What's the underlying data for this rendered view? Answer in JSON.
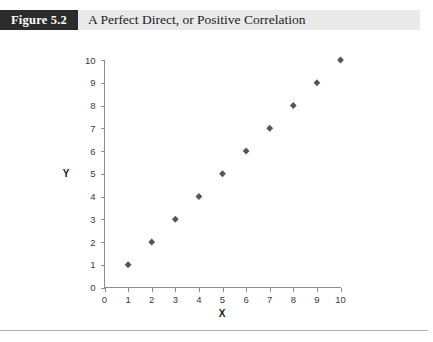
{
  "figure": {
    "badge_label": "Figure 5.2",
    "title": "A Perfect Direct, or Positive Correlation"
  },
  "colors": {
    "badge_background": "#2b2b2b",
    "badge_text": "#ffffff",
    "header_band": "#e9e9e9",
    "marker": "#565656",
    "axis": "#8d8d8d",
    "tick_text": "#3a3a3a",
    "rule": "#b0b0b0"
  },
  "chart_data": {
    "type": "scatter",
    "title": "A Perfect Direct, or Positive Correlation",
    "xlabel": "X",
    "ylabel": "Y",
    "xlim": [
      0,
      10
    ],
    "ylim": [
      0,
      10
    ],
    "xticks": [
      0,
      1,
      2,
      3,
      4,
      5,
      6,
      7,
      8,
      9,
      10
    ],
    "yticks": [
      0,
      1,
      2,
      3,
      4,
      5,
      6,
      7,
      8,
      9,
      10
    ],
    "xtick_labels": [
      "0",
      "1",
      "2",
      "3",
      "4",
      "5",
      "6",
      "7",
      "8",
      "9",
      "10"
    ],
    "ytick_labels": [
      "0",
      "1",
      "2",
      "3",
      "4",
      "5",
      "6",
      "7",
      "8",
      "9",
      "10"
    ],
    "grid": false,
    "legend": false,
    "marker": "diamond",
    "series": [
      {
        "name": "Perfect positive correlation",
        "x": [
          1,
          2,
          3,
          4,
          5,
          6,
          7,
          8,
          9,
          10
        ],
        "y": [
          1,
          2,
          3,
          4,
          5,
          6,
          7,
          8,
          9,
          10
        ]
      }
    ]
  }
}
